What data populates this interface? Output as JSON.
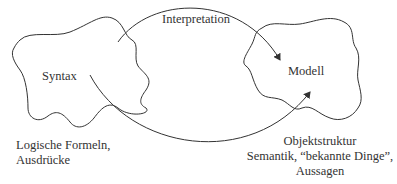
{
  "diagram": {
    "type": "concept-diagram",
    "nodes": [
      {
        "id": "syntax",
        "label": "Syntax",
        "shape": "irregular-blob"
      },
      {
        "id": "modell",
        "label": "Modell",
        "shape": "irregular-blob"
      }
    ],
    "edges": [
      {
        "from": "syntax",
        "to": "modell",
        "label": "Interpretation",
        "style": "upper-arc-arrow"
      },
      {
        "from": "syntax",
        "to": "modell",
        "label": "",
        "style": "lower-arc-arrow"
      }
    ],
    "annotations": {
      "syntax_caption_line1": "Logische Formeln,",
      "syntax_caption_line2": "Ausdrücke",
      "modell_caption_line1": "Objektstruktur",
      "modell_caption_line2": "Semantik, “bekannte Dinge”,",
      "modell_caption_line3": "Aussagen"
    },
    "colors": {
      "stroke": "#333333",
      "text": "#333333",
      "background": "#ffffff"
    }
  }
}
